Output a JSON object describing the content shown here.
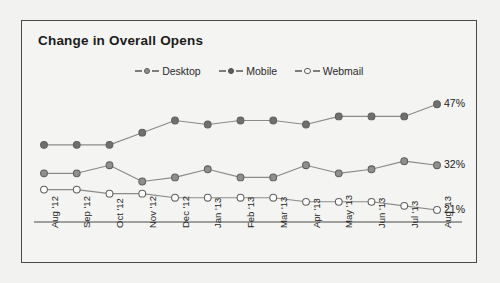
{
  "chart": {
    "title": "Change in Overall Opens"
  },
  "legend": {
    "position": "top-center",
    "items": [
      {
        "label": "Desktop",
        "marker": "open-circle-gray",
        "color": "#8f8f8f"
      },
      {
        "label": "Mobile",
        "marker": "filled-circle-dark",
        "color": "#6f6f6f"
      },
      {
        "label": "Webmail",
        "marker": "open-circle-white",
        "color": "#ffffff"
      }
    ]
  },
  "end_labels": [
    {
      "series": "Mobile",
      "text": "47%"
    },
    {
      "series": "Desktop",
      "text": "32%"
    },
    {
      "series": "Webmail",
      "text": "21%"
    }
  ],
  "chart_data": {
    "type": "line",
    "title": "Change in Overall Opens",
    "xlabel": "",
    "ylabel": "",
    "grid": false,
    "legend_position": "top-center",
    "ylim": [
      0,
      55
    ],
    "categories": [
      "Aug '12",
      "Sep '12",
      "Oct '12",
      "Nov '12",
      "Dec '12",
      "Jan '13",
      "Feb '13",
      "Mar '13",
      "Apr '13",
      "May '13",
      "Jun '13",
      "Jul '13",
      "Aug '13"
    ],
    "series": [
      {
        "name": "Mobile",
        "color": "#6f6f6f",
        "marker": "filled-circle",
        "end_label": "47%",
        "values": [
          37,
          37,
          37,
          40,
          43,
          42,
          43,
          43,
          42,
          44,
          44,
          44,
          47
        ]
      },
      {
        "name": "Desktop",
        "color": "#8f8f8f",
        "marker": "filled-circle-light",
        "end_label": "32%",
        "values": [
          30,
          30,
          32,
          28,
          29,
          31,
          29,
          29,
          32,
          30,
          31,
          33,
          32
        ]
      },
      {
        "name": "Webmail",
        "color": "#ffffff",
        "marker": "open-circle",
        "end_label": "21%",
        "values": [
          26,
          26,
          25,
          25,
          24,
          24,
          24,
          24,
          23,
          23,
          23,
          22,
          21
        ]
      }
    ]
  }
}
